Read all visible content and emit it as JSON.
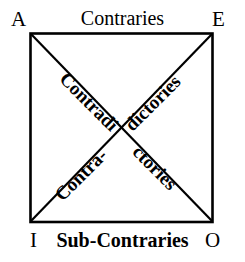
{
  "diagram": {
    "type": "logic-square",
    "stroke_color": "#000000",
    "background_color": "#ffffff",
    "vertices": [
      {
        "id": "A",
        "label": "A",
        "position": "top-left"
      },
      {
        "id": "E",
        "label": "E",
        "position": "top-right"
      },
      {
        "id": "I",
        "label": "I",
        "position": "bottom-left"
      },
      {
        "id": "O",
        "label": "O",
        "position": "bottom-right"
      }
    ],
    "edges": [
      {
        "id": "top",
        "from": "A",
        "to": "E",
        "label": "Contraries"
      },
      {
        "id": "bottom",
        "from": "I",
        "to": "O",
        "label": "Sub-Contraries"
      },
      {
        "id": "left",
        "from": "A",
        "to": "I",
        "label": ""
      },
      {
        "id": "right",
        "from": "E",
        "to": "O",
        "label": ""
      }
    ],
    "diagonals": [
      {
        "id": "a-o",
        "from": "A",
        "to": "O",
        "label": "Contradictories",
        "label_parts": [
          "Contradi",
          "ctories"
        ]
      },
      {
        "id": "i-e",
        "from": "I",
        "to": "E",
        "label": "Contradictories",
        "label_parts": [
          "Contra-",
          "dictories"
        ]
      }
    ],
    "labels": {
      "contraries": "Contraries",
      "sub_contraries": "Sub-Contraries",
      "contradi": "Contradi",
      "ctories": "ctories",
      "contra_hyphen": "Contra-",
      "dictories": "dictories",
      "vertex_a": "A",
      "vertex_e": "E",
      "vertex_i": "I",
      "vertex_o": "O"
    }
  }
}
